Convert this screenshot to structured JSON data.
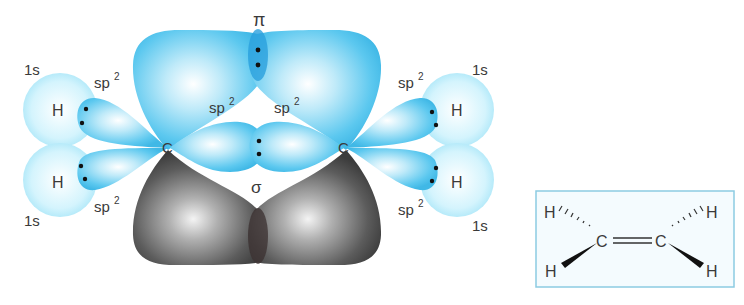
{
  "diagram": {
    "labels": {
      "pi": "π",
      "sigma": "σ",
      "carbon": "C",
      "hydrogen": "H",
      "s_orbital": "1s",
      "sp2_base": "sp",
      "sp2_sup": "2"
    },
    "left_carbon": {
      "atom": "C",
      "hydrogens": [
        {
          "atom": "H",
          "orbital": "1s",
          "bond_orbital": "sp2",
          "position": "upper-left"
        },
        {
          "atom": "H",
          "orbital": "1s",
          "bond_orbital": "sp2",
          "position": "lower-left"
        }
      ],
      "cc_orbital": "sp2"
    },
    "right_carbon": {
      "atom": "C",
      "hydrogens": [
        {
          "atom": "H",
          "orbital": "1s",
          "bond_orbital": "sp2",
          "position": "upper-right"
        },
        {
          "atom": "H",
          "orbital": "1s",
          "bond_orbital": "sp2",
          "position": "lower-right"
        }
      ],
      "cc_orbital": "sp2"
    },
    "bonds": [
      {
        "type": "pi",
        "label": "π",
        "between": "C-C",
        "formed_from": "p orbitals (upper blue / lower gray lobes)"
      },
      {
        "type": "sigma",
        "label": "σ",
        "between": "C-C",
        "formed_from": "sp2 + sp2"
      }
    ],
    "colors": {
      "orbital_blue": "#5cc8ef",
      "orbital_blue_light": "#c9f0fc",
      "s_orbital": "#bdeefb",
      "p_lobe_gray": "#5a5a5a",
      "overlap_blue": "#2aa0dd",
      "electron_dot": "#111111",
      "text": "#3a3a3a",
      "box_border": "#7cc6e0",
      "box_fill": "#f2fbfe"
    }
  },
  "structure_box": {
    "atoms": {
      "h_top_left": "H",
      "h_bottom_left": "H",
      "h_top_right": "H",
      "h_bottom_right": "H",
      "c_left": "C",
      "c_right": "C"
    },
    "bond": "C=C",
    "notation": "wedge-dash stereo"
  }
}
